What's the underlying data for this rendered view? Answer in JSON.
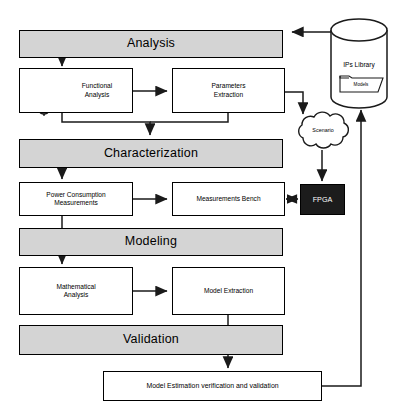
{
  "diagram": {
    "colors": {
      "band_fill": "#d4d4d4",
      "box_fill": "#ffffff",
      "stroke": "#000000",
      "fpga_fill": "#1c1c1c",
      "fpga_text": "#ffffff",
      "page_background": "#ffffff"
    },
    "phase_bands": [
      {
        "id": "analysis",
        "label": "Analysis"
      },
      {
        "id": "characterization",
        "label": "Characterization"
      },
      {
        "id": "modeling",
        "label": "Modeling"
      },
      {
        "id": "validation",
        "label": "Validation"
      }
    ],
    "process_boxes": [
      {
        "id": "functional-analysis",
        "label": "Functional\nAnalysis",
        "line1": "Functional",
        "line2": "Analysis"
      },
      {
        "id": "parameters-extraction",
        "label": "Parameters\nExtraction",
        "line1": "Parameters",
        "line2": "Extraction"
      },
      {
        "id": "power-consumption-measurements",
        "label": "Power Consumption\nMeasurements",
        "line1": "Power Consumption",
        "line2": "Measurements"
      },
      {
        "id": "measurements-bench",
        "label": "Measurements Bench",
        "line1": "Measurements Bench",
        "line2": ""
      },
      {
        "id": "mathematical-analysis",
        "label": "Mathematical\nAnalysis",
        "line1": "Mathematical",
        "line2": "Analysis"
      },
      {
        "id": "model-extraction",
        "label": "Model Extraction",
        "line1": "Model Extraction",
        "line2": ""
      },
      {
        "id": "model-estimation",
        "label": "Model Estimation verification and validation",
        "line1": "Model Estimation verification and validation",
        "line2": ""
      }
    ],
    "special_nodes": [
      {
        "id": "ips-library",
        "shape": "cylinder",
        "label": "IPs Library",
        "inner_label": "Models",
        "inner_icon": "folder-icon"
      },
      {
        "id": "scenario",
        "shape": "cloud",
        "label": "Scenario"
      },
      {
        "id": "fpga",
        "shape": "rectangle-filled",
        "label": "FPGA"
      }
    ],
    "icons": [
      {
        "id": "logic-gates",
        "name": "logic-gate-icon",
        "description": "three logic gates circuit"
      }
    ],
    "connections": [
      {
        "from": "ips-library",
        "to": "analysis",
        "type": "arrow"
      },
      {
        "from": "analysis",
        "to": "functional-analysis",
        "type": "arrow"
      },
      {
        "from": "functional-analysis",
        "to": "parameters-extraction",
        "type": "arrow"
      },
      {
        "from": "functional-analysis",
        "to": "characterization",
        "type": "arrow"
      },
      {
        "from": "parameters-extraction",
        "to": "characterization",
        "type": "arrow"
      },
      {
        "from": "parameters-extraction",
        "to": "scenario",
        "type": "arrow"
      },
      {
        "from": "characterization",
        "to": "power-consumption-measurements",
        "type": "arrow"
      },
      {
        "from": "power-consumption-measurements",
        "to": "measurements-bench",
        "type": "arrow"
      },
      {
        "from": "scenario",
        "to": "fpga",
        "type": "arrow"
      },
      {
        "from": "measurements-bench",
        "to": "fpga",
        "type": "double-arrow"
      },
      {
        "from": "power-consumption-measurements",
        "to": "modeling",
        "type": "line"
      },
      {
        "from": "modeling",
        "to": "mathematical-analysis",
        "type": "arrow"
      },
      {
        "from": "mathematical-analysis",
        "to": "model-extraction",
        "type": "arrow"
      },
      {
        "from": "model-extraction",
        "to": "validation",
        "type": "line"
      },
      {
        "from": "validation",
        "to": "model-estimation",
        "type": "arrow"
      },
      {
        "from": "model-estimation",
        "to": "ips-library",
        "type": "arrow"
      }
    ]
  }
}
